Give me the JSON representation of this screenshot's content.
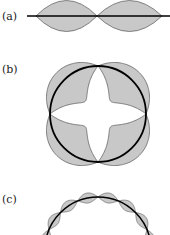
{
  "panels": [
    {
      "label": "(a)",
      "description": "Standing wave on a straight string with two loops"
    },
    {
      "label": "(b)",
      "description": "Standing wave on a circular loop with four loops"
    },
    {
      "label": "(c)",
      "description": "Standing wave on a circular loop with many small loops"
    }
  ],
  "colors": {
    "fill": "#c8c8c8",
    "stroke": "#000000",
    "outline": "#555555"
  }
}
